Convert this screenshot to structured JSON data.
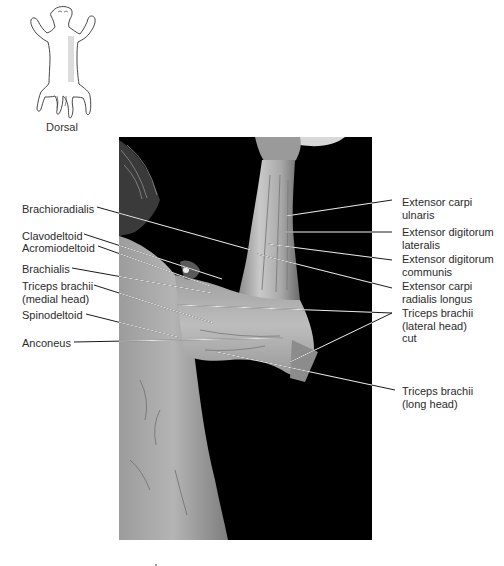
{
  "orientation_icon": {
    "icon": "cat-dorsal-silhouette-icon",
    "caption": "Dorsal",
    "shaded_region_color": "#dcdcdc"
  },
  "photo": {
    "description": "dissected cat forelimb, lateral view, on black background",
    "background_color": "#000000",
    "bounds": {
      "x": 119,
      "y": 137,
      "w": 253,
      "h": 403
    }
  },
  "leader_line_colors": {
    "on_dark": "#e8e8e8",
    "on_light": "#1a1a1a"
  },
  "labels_left": [
    {
      "id": "brachioradialis",
      "lines": [
        "Brachioradialis"
      ],
      "x": 22,
      "y": 203,
      "leader": [
        [
          97,
          207
        ],
        [
          251,
          250
        ]
      ]
    },
    {
      "id": "clavodeltoid",
      "lines": [
        "Clavodeltoid"
      ],
      "x": 22,
      "y": 230,
      "leader": [
        [
          84,
          234
        ],
        [
          222,
          279
        ]
      ]
    },
    {
      "id": "acromiodeltoid",
      "lines": [
        "Acromiodeltoid"
      ],
      "x": 22,
      "y": 242,
      "leader": [
        [
          98,
          246
        ],
        [
          210,
          286
        ]
      ]
    },
    {
      "id": "brachialis",
      "lines": [
        "Brachialis"
      ],
      "x": 22,
      "y": 263,
      "leader": [
        [
          72,
          268
        ],
        [
          212,
          293
        ]
      ]
    },
    {
      "id": "triceps-medial",
      "lines": [
        "Triceps brachii",
        "(medial head)"
      ],
      "x": 22,
      "y": 280,
      "leader": [
        [
          94,
          285
        ],
        [
          213,
          323
        ]
      ]
    },
    {
      "id": "spinodeltoid",
      "lines": [
        "Spinodeltoid"
      ],
      "x": 22,
      "y": 309,
      "leader": [
        [
          86,
          314
        ],
        [
          178,
          337
        ]
      ]
    },
    {
      "id": "anconeus",
      "lines": [
        "Anconeus"
      ],
      "x": 22,
      "y": 337,
      "leader": [
        [
          74,
          342
        ],
        [
          283,
          338
        ]
      ]
    }
  ],
  "labels_right": [
    {
      "id": "extensor-carpi-ulnaris",
      "lines": [
        "Extensor carpi",
        "ulnaris"
      ],
      "x": 402,
      "y": 196,
      "leader": [
        [
          392,
          200
        ],
        [
          286,
          216
        ]
      ]
    },
    {
      "id": "extensor-digitorum-lateralis",
      "lines": [
        "Extensor digitorum",
        "lateralis"
      ],
      "x": 402,
      "y": 226,
      "leader": [
        [
          392,
          232
        ],
        [
          279,
          232
        ]
      ]
    },
    {
      "id": "extensor-digitorum-communis",
      "lines": [
        "Extensor digitorum",
        "communis"
      ],
      "x": 402,
      "y": 253,
      "leader": [
        [
          392,
          260
        ],
        [
          268,
          244
        ]
      ]
    },
    {
      "id": "extensor-carpi-radialis-longus",
      "lines": [
        "Extensor carpi",
        "radialis longus"
      ],
      "x": 402,
      "y": 280,
      "leader": [
        [
          392,
          288
        ],
        [
          257,
          254
        ]
      ]
    },
    {
      "id": "triceps-lateral-cut",
      "lines": [
        "Triceps brachii",
        "(lateral head)",
        "cut"
      ],
      "x": 402,
      "y": 307,
      "leader": [
        [
          392,
          313
        ],
        [
          177,
          305
        ]
      ],
      "leader2": [
        [
          392,
          313
        ],
        [
          290,
          362
        ]
      ]
    },
    {
      "id": "triceps-long",
      "lines": [
        "Triceps brachii",
        "(long head)"
      ],
      "x": 402,
      "y": 385,
      "leader": [
        [
          395,
          390
        ],
        [
          217,
          352
        ]
      ]
    }
  ]
}
